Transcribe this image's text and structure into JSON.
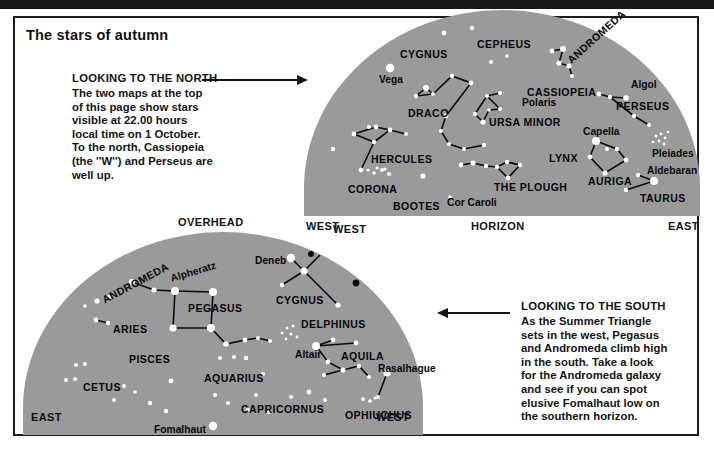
{
  "page": {
    "title": "The stars of autumn",
    "background": "#ffffff",
    "sky_color": "#9a9a9a",
    "ink_color": "#121316"
  },
  "captions": [
    {
      "id": "north",
      "heading": "LOOKING TO THE NORTH",
      "lines": [
        "The two maps at the top",
        "of this page show stars",
        "visible at 22.00 hours",
        "local time on 1 October.",
        "To the north, Cassiopeia",
        "(the ''W'') and Perseus are",
        "well up."
      ]
    },
    {
      "id": "south",
      "heading": "LOOKING TO THE SOUTH",
      "lines": [
        "As the Summer Triangle",
        "sets in the west, Pegasus",
        "and Andromeda climb high",
        "in the south. Take a look",
        "for the Andromeda galaxy",
        "and see if you can spot",
        "elusive Fomalhaut low on",
        "the southern horizon."
      ]
    }
  ],
  "labels": {
    "overhead": "OVERHEAD",
    "north_west": "WEST",
    "north_horizon": "HORIZON",
    "north_east": "EAST",
    "south_west_top": "WEST",
    "south_east": "EAST",
    "south_west_bottom": "WEST"
  },
  "north_map": {
    "title": "Looking to the north",
    "constellations": [
      "CYGNUS",
      "CEPHEUS",
      "ANDROMEDA",
      "CASSIOPEIA",
      "DRACO",
      "URSA MINOR",
      "PERSEUS",
      "HERCULES",
      "LYNX",
      "AURIGA",
      "THE PLOUGH",
      "CORONA",
      "BOOTES",
      "TAURUS"
    ],
    "stars_named": [
      "Vega",
      "Polaris",
      "Algol",
      "Capella",
      "Pleiades",
      "Aldebaran",
      "Cor Caroli"
    ],
    "sky_labels": [
      {
        "text": "CYGNUS",
        "x": 96,
        "y": 31,
        "kind": "con",
        "rot": 0
      },
      {
        "text": "CEPHEUS",
        "x": 173,
        "y": 21,
        "kind": "con",
        "rot": 0
      },
      {
        "text": "ANDROMEDA",
        "x": 265,
        "y": 38,
        "kind": "con",
        "rot": -42
      },
      {
        "text": "CASSIOPEIA",
        "x": 223,
        "y": 69,
        "kind": "con",
        "rot": 0
      },
      {
        "text": "Vega",
        "x": 75,
        "y": 57,
        "kind": "star",
        "rot": 0
      },
      {
        "text": "DRACO",
        "x": 104,
        "y": 90,
        "kind": "con",
        "rot": 0
      },
      {
        "text": "Polaris",
        "x": 218,
        "y": 80,
        "kind": "star",
        "rot": 0
      },
      {
        "text": "URSA MINOR",
        "x": 185,
        "y": 99,
        "kind": "con",
        "rot": 0
      },
      {
        "text": "Algol",
        "x": 327,
        "y": 62,
        "kind": "star",
        "rot": 0
      },
      {
        "text": "PERSEUS",
        "x": 312,
        "y": 83,
        "kind": "con",
        "rot": 0
      },
      {
        "text": "Capella",
        "x": 279,
        "y": 109,
        "kind": "star",
        "rot": 0
      },
      {
        "text": "LYNX",
        "x": 245,
        "y": 135,
        "kind": "con",
        "rot": 0
      },
      {
        "text": "Pleiades",
        "x": 348,
        "y": 131,
        "kind": "star",
        "rot": 0
      },
      {
        "text": "Aldebaran",
        "x": 343,
        "y": 148,
        "kind": "star",
        "rot": 0
      },
      {
        "text": "HERCULES",
        "x": 67,
        "y": 136,
        "kind": "con",
        "rot": 0
      },
      {
        "text": "AURIGA",
        "x": 284,
        "y": 158,
        "kind": "con",
        "rot": 0
      },
      {
        "text": "THE PLOUGH",
        "x": 190,
        "y": 164,
        "kind": "con",
        "rot": 0
      },
      {
        "text": "TAURUS",
        "x": 336,
        "y": 175,
        "kind": "con",
        "rot": 0
      },
      {
        "text": "CORONA",
        "x": 44,
        "y": 166,
        "kind": "con",
        "rot": 0
      },
      {
        "text": "BOOTES",
        "x": 89,
        "y": 183,
        "kind": "con",
        "rot": 0
      },
      {
        "text": "Cor Caroli",
        "x": 143,
        "y": 180,
        "kind": "star",
        "rot": 0
      }
    ],
    "stars": [
      {
        "x": 86,
        "y": 50,
        "r": 4.2
      },
      {
        "x": 65,
        "y": 109,
        "r": 2.0
      },
      {
        "x": 29,
        "y": 131,
        "r": 2.2
      },
      {
        "x": 140,
        "y": 15,
        "r": 2.4
      },
      {
        "x": 187,
        "y": 44,
        "r": 2.0
      },
      {
        "x": 168,
        "y": 10,
        "r": 2.2
      },
      {
        "x": 203,
        "y": 38,
        "r": 1.8
      },
      {
        "x": 122,
        "y": 70,
        "r": 3.0
      },
      {
        "x": 112,
        "y": 78,
        "r": 2.2
      },
      {
        "x": 129,
        "y": 76,
        "r": 2.0
      },
      {
        "x": 148,
        "y": 58,
        "r": 2.2
      },
      {
        "x": 167,
        "y": 65,
        "r": 2.4
      },
      {
        "x": 142,
        "y": 98,
        "r": 2.4
      },
      {
        "x": 137,
        "y": 113,
        "r": 2.0
      },
      {
        "x": 145,
        "y": 126,
        "r": 2.0
      },
      {
        "x": 160,
        "y": 131,
        "r": 2.0
      },
      {
        "x": 180,
        "y": 127,
        "r": 2.2
      },
      {
        "x": 183,
        "y": 78,
        "r": 2.0
      },
      {
        "x": 196,
        "y": 75,
        "r": 2.0
      },
      {
        "x": 171,
        "y": 96,
        "r": 2.2
      },
      {
        "x": 179,
        "y": 104,
        "r": 2.6
      },
      {
        "x": 185,
        "y": 92,
        "r": 1.8
      },
      {
        "x": 196,
        "y": 91,
        "r": 2.0
      },
      {
        "x": 248,
        "y": 33,
        "r": 2.4
      },
      {
        "x": 259,
        "y": 31,
        "r": 3.0
      },
      {
        "x": 255,
        "y": 45,
        "r": 2.6
      },
      {
        "x": 265,
        "y": 48,
        "r": 2.6
      },
      {
        "x": 268,
        "y": 58,
        "r": 2.0
      },
      {
        "x": 295,
        "y": 76,
        "r": 2.4
      },
      {
        "x": 306,
        "y": 79,
        "r": 2.2
      },
      {
        "x": 322,
        "y": 80,
        "r": 2.8
      },
      {
        "x": 330,
        "y": 98,
        "r": 2.2
      },
      {
        "x": 345,
        "y": 107,
        "r": 2.0
      },
      {
        "x": 292,
        "y": 123,
        "r": 4.0
      },
      {
        "x": 303,
        "y": 131,
        "r": 2.0
      },
      {
        "x": 286,
        "y": 139,
        "r": 2.4
      },
      {
        "x": 313,
        "y": 131,
        "r": 2.2
      },
      {
        "x": 322,
        "y": 142,
        "r": 2.4
      },
      {
        "x": 301,
        "y": 155,
        "r": 2.6
      },
      {
        "x": 334,
        "y": 157,
        "r": 2.2
      },
      {
        "x": 350,
        "y": 163,
        "r": 4.0
      },
      {
        "x": 322,
        "y": 172,
        "r": 2.2
      },
      {
        "x": 50,
        "y": 116,
        "r": 2.4
      },
      {
        "x": 72,
        "y": 109,
        "r": 2.4
      },
      {
        "x": 86,
        "y": 112,
        "r": 2.4
      },
      {
        "x": 70,
        "y": 124,
        "r": 2.2
      },
      {
        "x": 102,
        "y": 116,
        "r": 2.0
      },
      {
        "x": 57,
        "y": 152,
        "r": 2.4
      },
      {
        "x": 70,
        "y": 155,
        "r": 1.8
      },
      {
        "x": 78,
        "y": 152,
        "r": 2.0
      },
      {
        "x": 85,
        "y": 156,
        "r": 2.0
      },
      {
        "x": 119,
        "y": 158,
        "r": 2.6
      },
      {
        "x": 157,
        "y": 147,
        "r": 2.4
      },
      {
        "x": 169,
        "y": 145,
        "r": 2.6
      },
      {
        "x": 182,
        "y": 148,
        "r": 2.2
      },
      {
        "x": 193,
        "y": 149,
        "r": 2.2
      },
      {
        "x": 203,
        "y": 144,
        "r": 2.2
      },
      {
        "x": 204,
        "y": 160,
        "r": 2.4
      },
      {
        "x": 216,
        "y": 147,
        "r": 2.2
      },
      {
        "x": 146,
        "y": 179,
        "r": 1.8
      }
    ]
  },
  "south_map": {
    "title": "Looking to the south",
    "constellations": [
      "ANDROMEDA",
      "PEGASUS",
      "CYGNUS",
      "DELPHINUS",
      "AQUILA",
      "ARIES",
      "PISCES",
      "AQUARIUS",
      "CETUS",
      "CAPRICORNUS",
      "OPHIUCHUS"
    ],
    "stars_named": [
      "Deneb",
      "Alpheratz",
      "Altair",
      "Rasalhague",
      "Fomalhaut"
    ],
    "sky_labels": [
      {
        "text": "Deneb",
        "x": 232,
        "y": 16,
        "kind": "star",
        "rot": 0
      },
      {
        "text": "Alpheratz",
        "x": 148,
        "y": 34,
        "kind": "star",
        "rot": -17
      },
      {
        "text": "ANDROMEDA",
        "x": 80,
        "y": 55,
        "kind": "con",
        "rot": -28
      },
      {
        "text": "PEGASUS",
        "x": 165,
        "y": 63,
        "kind": "con",
        "rot": 0
      },
      {
        "text": "CYGNUS",
        "x": 253,
        "y": 55,
        "kind": "con",
        "rot": 0
      },
      {
        "text": "DELPHINUS",
        "x": 278,
        "y": 79,
        "kind": "con",
        "rot": 0
      },
      {
        "text": "ARIES",
        "x": 90,
        "y": 84,
        "kind": "con",
        "rot": 0
      },
      {
        "text": "PISCES",
        "x": 106,
        "y": 114,
        "kind": "con",
        "rot": 0
      },
      {
        "text": "Altair",
        "x": 272,
        "y": 110,
        "kind": "star",
        "rot": 0
      },
      {
        "text": "AQUILA",
        "x": 318,
        "y": 111,
        "kind": "con",
        "rot": 0
      },
      {
        "text": "Rasalhague",
        "x": 355,
        "y": 124,
        "kind": "star",
        "rot": 0
      },
      {
        "text": "AQUARIUS",
        "x": 181,
        "y": 133,
        "kind": "con",
        "rot": 0
      },
      {
        "text": "CETUS",
        "x": 60,
        "y": 142,
        "kind": "con",
        "rot": 0
      },
      {
        "text": "CAPRICORNUS",
        "x": 218,
        "y": 164,
        "kind": "con",
        "rot": 0
      },
      {
        "text": "OPHIUCHUS",
        "x": 322,
        "y": 170,
        "kind": "con",
        "rot": 0
      },
      {
        "text": "Fomalhaut",
        "x": 131,
        "y": 185,
        "kind": "star",
        "rot": 0
      }
    ],
    "stars": [
      {
        "x": 268,
        "y": 18,
        "r": 4.2
      },
      {
        "x": 281,
        "y": 31,
        "r": 3.6
      },
      {
        "x": 259,
        "y": 45,
        "r": 2.2
      },
      {
        "x": 315,
        "y": 65,
        "r": 2.6
      },
      {
        "x": 109,
        "y": 42,
        "r": 3.0
      },
      {
        "x": 131,
        "y": 50,
        "r": 2.6
      },
      {
        "x": 152,
        "y": 51,
        "r": 4.0
      },
      {
        "x": 190,
        "y": 52,
        "r": 4.0
      },
      {
        "x": 150,
        "y": 88,
        "r": 3.6
      },
      {
        "x": 188,
        "y": 88,
        "r": 4.0
      },
      {
        "x": 74,
        "y": 61,
        "r": 2.6
      },
      {
        "x": 86,
        "y": 57,
        "r": 2.2
      },
      {
        "x": 62,
        "y": 66,
        "r": 1.8
      },
      {
        "x": 73,
        "y": 80,
        "r": 2.4
      },
      {
        "x": 85,
        "y": 83,
        "r": 2.2
      },
      {
        "x": 222,
        "y": 100,
        "r": 2.4
      },
      {
        "x": 235,
        "y": 98,
        "r": 2.0
      },
      {
        "x": 247,
        "y": 101,
        "r": 2.0
      },
      {
        "x": 203,
        "y": 104,
        "r": 2.8
      },
      {
        "x": 211,
        "y": 117,
        "r": 2.0
      },
      {
        "x": 197,
        "y": 118,
        "r": 2.0
      },
      {
        "x": 223,
        "y": 118,
        "r": 2.2
      },
      {
        "x": 240,
        "y": 134,
        "r": 2.0
      },
      {
        "x": 148,
        "y": 141,
        "r": 2.4
      },
      {
        "x": 192,
        "y": 155,
        "r": 2.0
      },
      {
        "x": 233,
        "y": 155,
        "r": 2.0
      },
      {
        "x": 268,
        "y": 157,
        "r": 2.0
      },
      {
        "x": 286,
        "y": 152,
        "r": 2.4
      },
      {
        "x": 302,
        "y": 160,
        "r": 2.0
      },
      {
        "x": 246,
        "y": 172,
        "r": 2.2
      },
      {
        "x": 225,
        "y": 170,
        "r": 2.0
      },
      {
        "x": 205,
        "y": 163,
        "r": 2.0
      },
      {
        "x": 53,
        "y": 125,
        "r": 2.0
      },
      {
        "x": 62,
        "y": 124,
        "r": 2.0
      },
      {
        "x": 43,
        "y": 140,
        "r": 2.0
      },
      {
        "x": 52,
        "y": 139,
        "r": 2.0
      },
      {
        "x": 101,
        "y": 146,
        "r": 2.0
      },
      {
        "x": 112,
        "y": 152,
        "r": 1.8
      },
      {
        "x": 91,
        "y": 160,
        "r": 2.0
      },
      {
        "x": 127,
        "y": 163,
        "r": 2.2
      },
      {
        "x": 143,
        "y": 171,
        "r": 2.2
      },
      {
        "x": 190,
        "y": 186,
        "r": 4.2
      },
      {
        "x": 293,
        "y": 106,
        "r": 4.0
      },
      {
        "x": 310,
        "y": 100,
        "r": 2.4
      },
      {
        "x": 333,
        "y": 103,
        "r": 2.4
      },
      {
        "x": 305,
        "y": 122,
        "r": 2.4
      },
      {
        "x": 320,
        "y": 130,
        "r": 2.6
      },
      {
        "x": 336,
        "y": 126,
        "r": 2.2
      },
      {
        "x": 346,
        "y": 137,
        "r": 2.0
      },
      {
        "x": 301,
        "y": 135,
        "r": 2.0
      },
      {
        "x": 364,
        "y": 133,
        "r": 3.6
      },
      {
        "x": 355,
        "y": 157,
        "r": 2.0
      },
      {
        "x": 347,
        "y": 161,
        "r": 1.8
      },
      {
        "x": 340,
        "y": 159,
        "r": 1.8
      }
    ]
  }
}
